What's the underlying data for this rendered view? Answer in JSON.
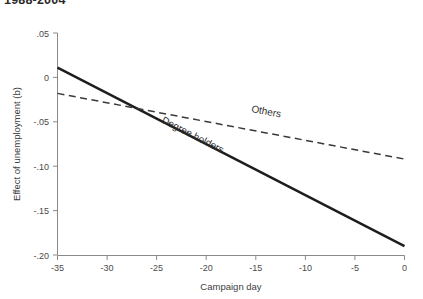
{
  "figure": {
    "clipped_heading": "1988-2004"
  },
  "chart_data": {
    "type": "line",
    "title": "",
    "xlabel": "Campaign day",
    "ylabel": "Effect of unemployment (b)",
    "xlim": [
      -35,
      0
    ],
    "ylim": [
      -0.2,
      0.05
    ],
    "xticks": [
      -35,
      -30,
      -25,
      -20,
      -15,
      -10,
      -5,
      0
    ],
    "xtick_labels": [
      "-35",
      "-30",
      "-25",
      "-20",
      "-15",
      "-10",
      "-5",
      "0"
    ],
    "yticks": [
      0.05,
      0,
      -0.05,
      -0.1,
      -0.15,
      -0.2
    ],
    "ytick_labels": [
      ".05",
      "0",
      "-.05",
      "-.10",
      "-.15",
      "-.20"
    ],
    "grid": false,
    "legend_position": "inline-annotations",
    "series": [
      {
        "name": "Degree holders",
        "style": "solid",
        "color": "#1d1d1d",
        "x": [
          -35,
          0
        ],
        "values": [
          0.011,
          -0.19
        ],
        "label_x": -21.5,
        "label_y": -0.068
      },
      {
        "name": "Others",
        "style": "dashed",
        "color": "#3a3a3a",
        "x": [
          -35,
          0
        ],
        "values": [
          -0.018,
          -0.092
        ],
        "label_x": -14.0,
        "label_y": -0.042
      }
    ],
    "annotations": [
      {
        "text": "Others",
        "series": "Others"
      },
      {
        "text": "Degree holders",
        "series": "Degree holders"
      }
    ]
  }
}
